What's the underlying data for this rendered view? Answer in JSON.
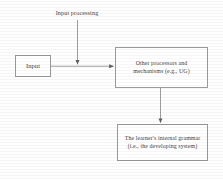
{
  "diagram": {
    "caption": {
      "input_processing_label": "Input processing"
    },
    "nodes": [
      {
        "id": "input",
        "label": "Input",
        "lines": [
          "Input"
        ]
      },
      {
        "id": "processors",
        "label": "Other processors and mechanisms (e.g., UG)",
        "lines": [
          "Other processors and",
          "mechanisms (e.g., UG)"
        ]
      },
      {
        "id": "grammar",
        "label": "The learner's internal grammar (i.e., the developing system)",
        "lines": [
          "The learner's internal grammar",
          "(i.e., the developing system)"
        ]
      }
    ],
    "edges": [
      {
        "id": "input-to-processors",
        "from": "input",
        "to": "processors",
        "direction": "right"
      },
      {
        "id": "processing-to-stream",
        "from": "input-processing-label",
        "to": "input-to-processors",
        "direction": "down"
      },
      {
        "id": "processors-to-grammar",
        "from": "processors",
        "to": "grammar",
        "direction": "down"
      }
    ],
    "colors": {
      "background": "#ffffff",
      "box_border": "#9a9a9a",
      "text": "#3f3f3f",
      "connector": "#6b6b6b"
    }
  }
}
